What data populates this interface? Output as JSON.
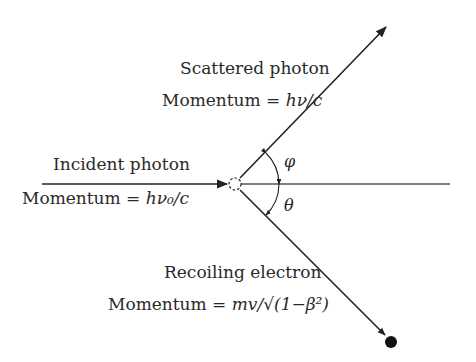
{
  "labels": {
    "scattered_title": "Scattered photon",
    "scattered_momentum_prefix": "Momentum = ",
    "scattered_momentum_expr": "hν/c",
    "incident_title": "Incident photon",
    "incident_momentum_prefix": "Momentum = ",
    "incident_momentum_expr": "hν₀/c",
    "electron_title": "Recoiling electron",
    "electron_momentum_prefix": "Momentum = ",
    "electron_momentum_expr": "mv/√(1−β²)",
    "phi": "φ",
    "theta": "θ"
  },
  "geometry": {
    "origin": [
      235,
      184
    ],
    "incident_start": [
      42,
      184
    ],
    "axis_end": [
      450,
      184
    ],
    "scattered_tip": [
      386,
      27
    ],
    "electron_pos": [
      391,
      342
    ]
  },
  "colors": {
    "ink": "#222222",
    "axis": "#555555",
    "background": "#ffffff"
  }
}
